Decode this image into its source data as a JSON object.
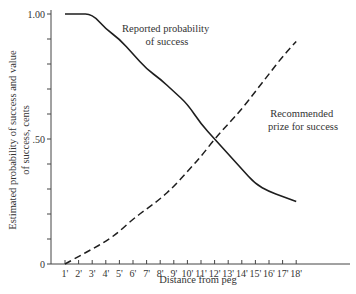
{
  "chart_data": {
    "type": "line",
    "title": "",
    "xlabel": "Distance from peg",
    "ylabel": [
      "Estimated probability of success and value",
      "of success, cents"
    ],
    "x": [
      "1'",
      "2'",
      "3'",
      "4'",
      "5'",
      "6'",
      "7'",
      "8'",
      "9'",
      "10'",
      "11'",
      "12'",
      "13'",
      "14'",
      "15'",
      "16'",
      "17'",
      "18'"
    ],
    "ylim": [
      0,
      1.0
    ],
    "ytick_labels": [
      "0",
      ".50",
      "1.00"
    ],
    "yticks_minor_step": 0.1,
    "grid": false,
    "legend": "inline annotations",
    "series": [
      {
        "name": "Reported probability of success",
        "style": "solid",
        "values": [
          1.0,
          1.0,
          1.0,
          0.94,
          0.9,
          0.84,
          0.78,
          0.74,
          0.69,
          0.64,
          0.56,
          0.5,
          0.44,
          0.38,
          0.32,
          0.29,
          0.27,
          0.25
        ]
      },
      {
        "name": "Recommended prize for success",
        "style": "dashed",
        "values": [
          0.0,
          0.03,
          0.06,
          0.09,
          0.13,
          0.18,
          0.22,
          0.26,
          0.31,
          0.37,
          0.43,
          0.5,
          0.56,
          0.62,
          0.69,
          0.76,
          0.83,
          0.89
        ]
      }
    ],
    "annotations": [
      {
        "text": [
          "Reported probability",
          "of success"
        ],
        "series": 0
      },
      {
        "text": [
          "Recommended",
          "prize for success"
        ],
        "series": 1
      }
    ]
  }
}
